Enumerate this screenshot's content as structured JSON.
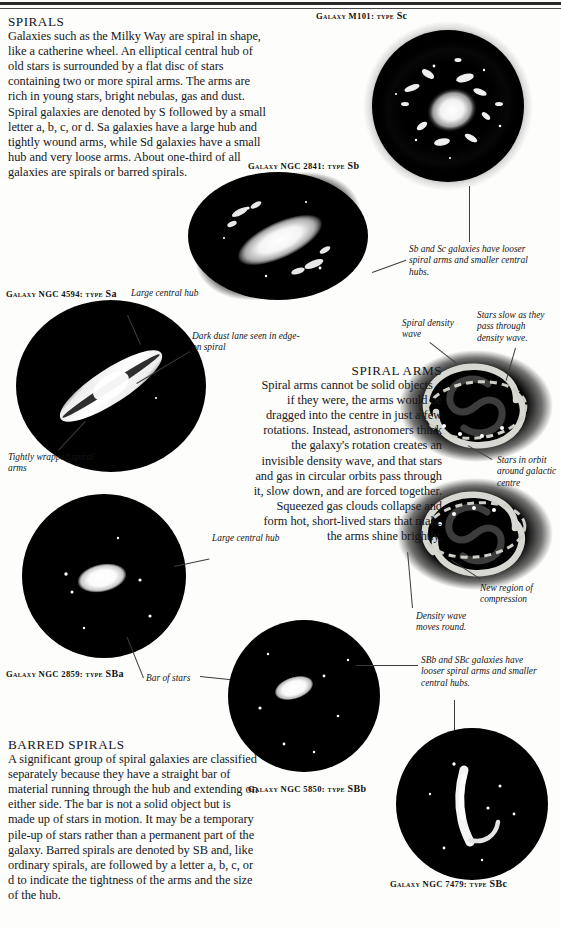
{
  "page": {
    "background": "#fdfdfb",
    "ink": "#17171a"
  },
  "sections": {
    "spirals": {
      "heading": "SPIRALS",
      "body": "Galaxies such as the Milky Way are spiral in shape, like a catherine wheel. An elliptical central hub of old stars is surrounded by a flat disc of stars containing two or more spiral arms. The arms are rich in young stars, bright nebulas, gas and dust. Spiral galaxies are denoted by S followed by a small letter a, b, c, or d. Sa galaxies have a large hub and tightly wound arms, while Sd galaxies have a small hub and very loose arms. About one-third of all galaxies are spirals or barred spirals."
    },
    "spiral_arms": {
      "heading": "SPIRAL ARMS",
      "body": "Spiral arms cannot be solid objects – if they were, the arms would be dragged into the centre in just a few rotations. Instead, astronomers think the galaxy's rotation creates an invisible density wave, and that stars and gas in circular orbits pass through it, slow down, and are forced together. Squeezed gas clouds collapse and form hot, short-lived stars that make the arms shine brightly."
    },
    "barred_spirals": {
      "heading": "BARRED SPIRALS",
      "body": "A significant group of spiral galaxies are classified separately because they have a straight bar of material running through the hub and extending on either side. The bar is not a solid object but is made up of stars in motion. It may be a temporary pile-up of stars rather than a permanent part of the galaxy. Barred spirals are denoted by SB and, like ordinary spirals, are followed by a letter a, b, c, or d to indicate the tightness of the arms and the size of the hub."
    }
  },
  "captions": {
    "m101": {
      "prefix": "Galaxy M101: type ",
      "type": "Sc"
    },
    "ngc2841": {
      "prefix": "Galaxy NGC 2841: type ",
      "type": "Sb"
    },
    "ngc4594": {
      "prefix": "Galaxy NGC 4594: type ",
      "type": "Sa"
    },
    "ngc2859": {
      "prefix": "Galaxy NGC 2859: type ",
      "type": "SBa"
    },
    "ngc5850": {
      "prefix": "Galaxy NGC 5850: type ",
      "type": "SBb"
    },
    "ngc7479": {
      "prefix": "Galaxy NGC 7479: type ",
      "type": "SBc"
    }
  },
  "annotations": {
    "sb_sc_note": "Sb and Sc galaxies have looser spiral arms and smaller central hubs.",
    "large_central_hub_top": "Large central hub",
    "dark_dust_lane": "Dark dust lane seen in edge-on spiral",
    "tightly_wrapped": "Tightly wrapped spiral arms",
    "large_central_hub_mid": "Large central hub",
    "bar_of_stars": "Bar of stars",
    "spiral_density_wave": "Spiral density wave",
    "stars_slow": "Stars slow as they pass through density wave.",
    "stars_in_orbit": "Stars in orbit around galactic centre",
    "new_region": "New region of compression",
    "density_wave_moves": "Density wave moves round.",
    "sbb_sbc_note": "SBb and SBc galaxies have looser spiral arms and smaller central hubs."
  }
}
